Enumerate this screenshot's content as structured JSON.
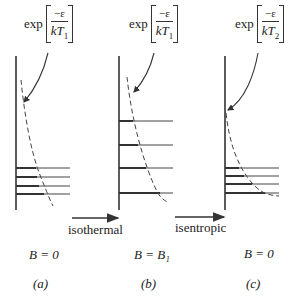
{
  "panels": [
    {
      "id": "a",
      "formula": {
        "prefix": "exp",
        "numerator": "−ε",
        "denominator_var": "kT",
        "subscript": "1"
      },
      "field_label": "B = 0",
      "caption": "(a)"
    },
    {
      "id": "b",
      "formula": {
        "prefix": "exp",
        "numerator": "−ε",
        "denominator_var": "kT",
        "subscript": "1"
      },
      "field_label": "B = B₁",
      "caption": "(b)"
    },
    {
      "id": "c",
      "formula": {
        "prefix": "exp",
        "numerator": "−ε",
        "denominator_var": "kT",
        "subscript": "2"
      },
      "field_label": "B = 0",
      "caption": "(c)"
    }
  ],
  "arrows": [
    {
      "label": "isothermal"
    },
    {
      "label": "isentropic"
    }
  ]
}
